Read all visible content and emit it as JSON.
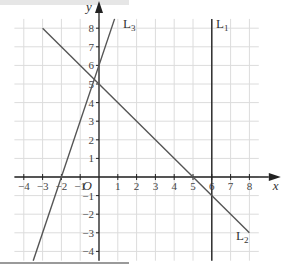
{
  "chart_data": {
    "type": "line",
    "title": "",
    "xlabel": "x",
    "ylabel": "y",
    "origin_label": "O",
    "xlim": [
      -4.5,
      8.5
    ],
    "ylim": [
      -4.5,
      8.5
    ],
    "grid": true,
    "x_ticks": [
      -4,
      -3,
      -2,
      -1,
      1,
      2,
      3,
      4,
      5,
      6,
      7,
      8
    ],
    "y_ticks": [
      -4,
      -3,
      -2,
      -1,
      1,
      2,
      3,
      4,
      5,
      6,
      7,
      8
    ],
    "series": [
      {
        "name": "L1",
        "label": "L1",
        "equation": "x = 6",
        "points": [
          [
            6,
            -4.5
          ],
          [
            6,
            8.5
          ]
        ]
      },
      {
        "name": "L2",
        "label": "L2",
        "equation": "y = 5 - x",
        "points": [
          [
            -3,
            8
          ],
          [
            8,
            -3
          ]
        ]
      },
      {
        "name": "L3",
        "label": "L3",
        "equation": "y = 3x + 6",
        "points": [
          [
            -3.5,
            -4.5
          ],
          [
            0.83,
            8.5
          ]
        ]
      }
    ]
  },
  "labels": {
    "x_axis": "x",
    "y_axis": "y",
    "origin": "O",
    "l1": "L",
    "l1_sub": "1",
    "l2": "L",
    "l2_sub": "2",
    "l3": "L",
    "l3_sub": "3"
  },
  "colors": {
    "grid": "#dcdcdc",
    "axis": "#222222",
    "line": "#555555"
  }
}
